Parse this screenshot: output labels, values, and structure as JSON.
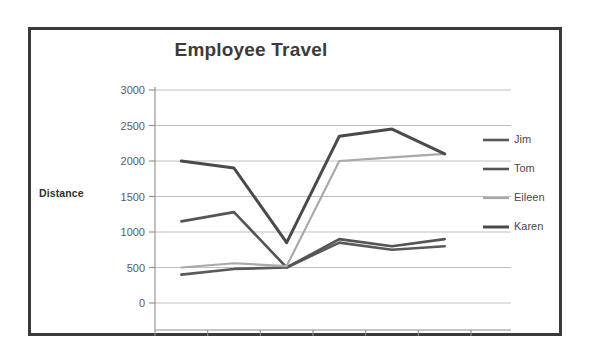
{
  "chart_data": {
    "type": "line",
    "title": "Employee Travel",
    "xlabel": "",
    "ylabel": "Distance",
    "categories": [
      "Jan",
      "Feb",
      "Mar",
      "Apr",
      "May",
      "Jun"
    ],
    "ylim": [
      0,
      3000
    ],
    "yticks": [
      0,
      500,
      1000,
      1500,
      2000,
      2500,
      3000
    ],
    "grid": true,
    "legend_position": "right",
    "series": [
      {
        "name": "Jim",
        "color": "#5a5a5a",
        "width": 2.6,
        "values": [
          400,
          480,
          500,
          850,
          750,
          800
        ]
      },
      {
        "name": "Tom",
        "color": "#545454",
        "width": 2.6,
        "values": [
          1150,
          1280,
          500,
          900,
          800,
          900
        ]
      },
      {
        "name": "Eileen",
        "color": "#a9a9a9",
        "width": 2.2,
        "values": [
          500,
          560,
          520,
          2000,
          2050,
          2100
        ]
      },
      {
        "name": "Karen",
        "color": "#4a4a4a",
        "width": 3.0,
        "values": [
          2000,
          1900,
          850,
          2350,
          2450,
          2100
        ]
      }
    ]
  },
  "chart": {
    "title": "Employee Travel",
    "y_axis_title": "Distance",
    "y_tick_labels": [
      "3000",
      "2500",
      "2000",
      "1500",
      "1000",
      "500",
      "0"
    ],
    "x_tick_labels": [
      "Jan",
      "Feb",
      "Mar",
      "Apr",
      "May",
      "Jun"
    ],
    "legend_items": [
      {
        "label": "Jim"
      },
      {
        "label": "Tom"
      },
      {
        "label": "Eileen"
      },
      {
        "label": "Karen"
      }
    ]
  },
  "colors": {
    "frame_border": "#3a3a3a",
    "background": "#ffffff",
    "gridline": "#b9b9b9",
    "axis": "#8f8f8f",
    "title_text": "#3b3b3b",
    "tick_text": "#5d5d5d",
    "legend_text": "#4a4a4a"
  }
}
